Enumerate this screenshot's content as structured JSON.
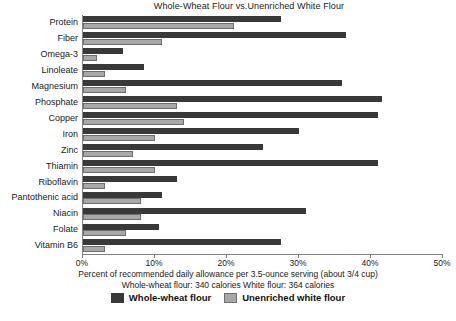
{
  "chart_data": {
    "type": "bar",
    "orientation": "horizontal",
    "title": "Whole-Wheat Flour vs.Unenriched White Flour",
    "xlabel": "Percent of recommended daily allowance per 3.5-ounce serving (about 3/4 cup)",
    "ylabel": "",
    "xlim": [
      0,
      50
    ],
    "xticks": [
      0,
      10,
      20,
      30,
      40,
      50
    ],
    "xtick_labels": [
      "0%",
      "10%",
      "20%",
      "30%",
      "40%",
      "50%"
    ],
    "grid": false,
    "legend_position": "bottom",
    "categories": [
      "Protein",
      "Fiber",
      "Omega-3",
      "Linoleate",
      "Magnesium",
      "Phosphate",
      "Copper",
      "Iron",
      "Zinc",
      "Thiamin",
      "Riboflavin",
      "Pantothenic acid",
      "Niacin",
      "Folate",
      "Vitamin B6"
    ],
    "series": [
      {
        "name": "Whole-wheat flour",
        "color": "#393939",
        "values": [
          27.5,
          36.5,
          5.5,
          8.5,
          36,
          41.5,
          41,
          30,
          25,
          41,
          13,
          11,
          31,
          10.5,
          27.5
        ]
      },
      {
        "name": "Unenriched white flour",
        "color": "#a8a8a8",
        "values": [
          21,
          11,
          2,
          3,
          6,
          13,
          14,
          10,
          7,
          10,
          3,
          8,
          8,
          6,
          3
        ]
      }
    ],
    "annotations": [
      "Whole-wheat flour: 340 calories   White flour: 364 calories"
    ]
  },
  "captions": {
    "axis_caption": "Percent of recommended daily allowance per 3.5-ounce serving (about 3/4 cup)",
    "calories_caption": "Whole-wheat flour: 340 calories   White flour: 364 calories"
  },
  "legend": {
    "items": [
      {
        "label": "Whole-wheat flour",
        "swatch": "dark"
      },
      {
        "label": "Unenriched white flour",
        "swatch": "light"
      }
    ]
  },
  "footer": {
    "source_text": ""
  },
  "colors": {
    "dark_bar": "#393939",
    "light_bar": "#a8a8a8",
    "axis": "#808080",
    "background": "#ffffff",
    "text": "#1a1a1a"
  }
}
